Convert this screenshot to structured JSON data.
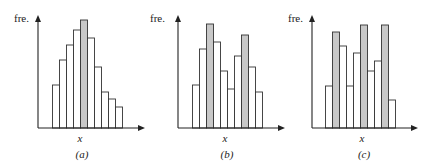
{
  "chart_data": [
    {
      "type": "bar",
      "title": "(a)",
      "ylabel": "fre.",
      "xlabel": "x",
      "grid": false,
      "description": "Unimodal, right-skewed histogram with a single highlighted mode bin",
      "categories": [
        "1",
        "2",
        "3",
        "4",
        "5",
        "6",
        "7",
        "8",
        "9",
        "10"
      ],
      "values": [
        43,
        68,
        83,
        98,
        108,
        90,
        61,
        36,
        29,
        21
      ],
      "highlight": [
        4
      ],
      "ylim": [
        0,
        113
      ]
    },
    {
      "type": "bar",
      "title": "(b)",
      "ylabel": "fre.",
      "xlabel": "x",
      "grid": false,
      "description": "Bimodal histogram with two highlighted peak bins",
      "categories": [
        "1",
        "2",
        "3",
        "4",
        "5",
        "6",
        "7",
        "8",
        "9",
        "10"
      ],
      "values": [
        43,
        79,
        104,
        86,
        57,
        39,
        72,
        93,
        61,
        36
      ],
      "highlight": [
        2,
        7
      ],
      "ylim": [
        0,
        113
      ]
    },
    {
      "type": "bar",
      "title": "(c)",
      "ylabel": "fre.",
      "xlabel": "x",
      "grid": false,
      "description": "Multimodal histogram with three highlighted peak bins",
      "categories": [
        "1",
        "2",
        "3",
        "4",
        "5",
        "6",
        "7",
        "8",
        "9",
        "10"
      ],
      "values": [
        42,
        96,
        82,
        42,
        75,
        103,
        57,
        67,
        103,
        28
      ],
      "highlight": [
        1,
        5,
        8
      ],
      "ylim": [
        0,
        113
      ]
    }
  ],
  "colors": {
    "bar_fill": "#ffffff",
    "highlight_fill": "#c8c8c8",
    "stroke": "#333333",
    "axis": "#222222"
  }
}
